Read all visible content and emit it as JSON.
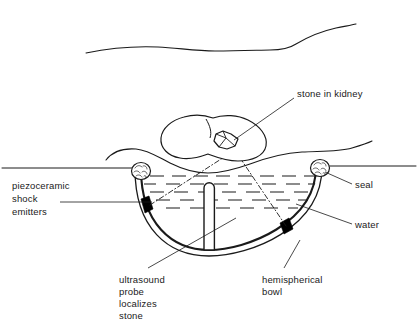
{
  "figure": {
    "line_color": "#1a1a1a",
    "fill_color": "#ffffff",
    "emitter_color": "#000000"
  },
  "labels": {
    "stone_in_kidney": "stone in kidney",
    "seal": "seal",
    "water": "water",
    "hemispherical_bowl_line1": "hemispherical",
    "hemispherical_bowl_line2": "bowl",
    "ultrasound_line1": "ultrasound",
    "ultrasound_line2": "probe",
    "ultrasound_line3": "localizes",
    "ultrasound_line4": "stone",
    "piezo_line1": "piezoceramic",
    "piezo_line2": "shock",
    "piezo_line3": "emitters"
  },
  "parts": {
    "body_outline": "patient-torso-curve",
    "skin_line": "skin-surface-line",
    "kidney": "kidney-outline",
    "stone": "kidney-stone",
    "bowl": "hemispherical-water-bowl",
    "probe": "ultrasound-probe",
    "seal_left": "seal-left",
    "seal_right": "seal-right",
    "emitter_left": "piezoceramic-emitter-left",
    "emitter_right": "piezoceramic-emitter-right",
    "water_hatch": "water-hatching",
    "focus_ray_left": "shock-focus-ray-left",
    "focus_ray_right": "shock-focus-ray-right"
  }
}
